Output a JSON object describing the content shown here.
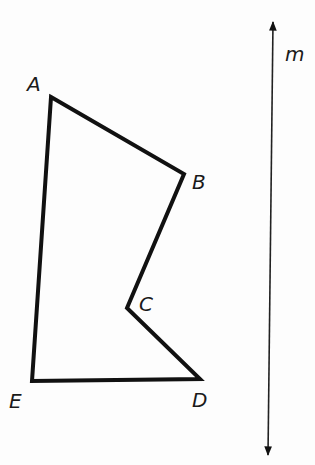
{
  "diagram": {
    "type": "polygon-with-line",
    "polygon": {
      "name": "ABCDE",
      "vertices": [
        {
          "label": "A",
          "x": 51,
          "y": 97
        },
        {
          "label": "B",
          "x": 184,
          "y": 174
        },
        {
          "label": "C",
          "x": 127,
          "y": 308
        },
        {
          "label": "D",
          "x": 200,
          "y": 379
        },
        {
          "label": "E",
          "x": 32,
          "y": 381
        }
      ]
    },
    "line": {
      "label": "m",
      "start": {
        "x": 273,
        "y": 13
      },
      "end": {
        "x": 268,
        "y": 463
      },
      "arrows": "both"
    },
    "labels": {
      "A": "A",
      "B": "B",
      "C": "C",
      "D": "D",
      "E": "E",
      "m": "m"
    },
    "colors": {
      "stroke": "#111111",
      "background": "#fdfdfd"
    }
  }
}
